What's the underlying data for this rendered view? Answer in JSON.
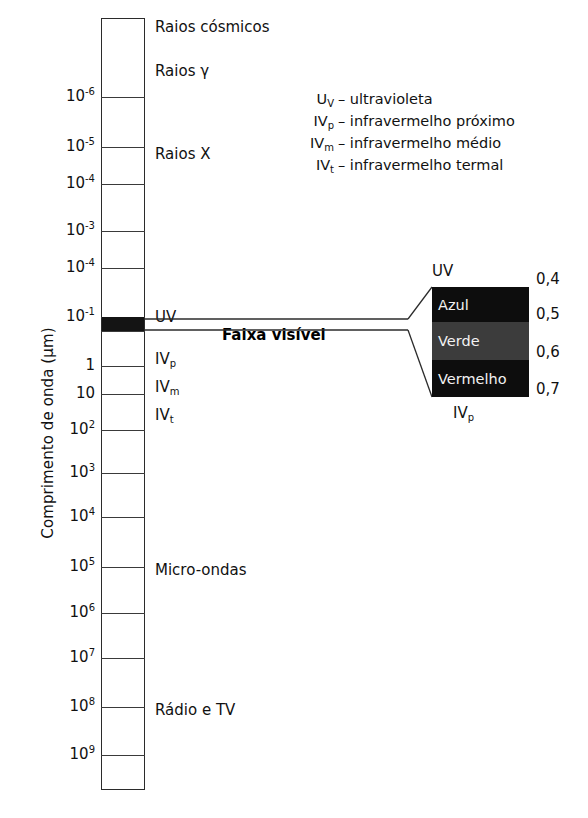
{
  "figure": {
    "axis_title": "Comprimento de onda (µm)"
  },
  "chart_data": {
    "type": "bar",
    "ylabel": "Comprimento de onda (µm)",
    "orientation": "vertical",
    "scale": "log",
    "tick_labels": [
      {
        "base": "10",
        "exp": "-6",
        "y": 97
      },
      {
        "base": "10",
        "exp": "-5",
        "y": 147
      },
      {
        "base": "10",
        "exp": "-4",
        "y": 184
      },
      {
        "base": "10",
        "exp": "-3",
        "y": 231
      },
      {
        "base": "10",
        "exp": "-4",
        "y": 268
      },
      {
        "base": "10",
        "exp": "-1",
        "y": 317
      },
      {
        "base": "1",
        "exp": "",
        "y": 366
      },
      {
        "base": "10",
        "exp": "",
        "y": 394
      },
      {
        "base": "10",
        "exp": "2",
        "y": 430
      },
      {
        "base": "10",
        "exp": "3",
        "y": 473
      },
      {
        "base": "10",
        "exp": "4",
        "y": 517
      },
      {
        "base": "10",
        "exp": "5",
        "y": 567
      },
      {
        "base": "10",
        "exp": "6",
        "y": 613
      },
      {
        "base": "10",
        "exp": "7",
        "y": 658
      },
      {
        "base": "10",
        "exp": "8",
        "y": 707
      },
      {
        "base": "10",
        "exp": "9",
        "y": 755
      }
    ],
    "tick_line_y": [
      97,
      147,
      184,
      231,
      268,
      317,
      331,
      366,
      394,
      430,
      473,
      517,
      567,
      613,
      658,
      707,
      755
    ],
    "visible_band": {
      "top": 317,
      "bottom": 331,
      "color": "#141414"
    },
    "bands": [
      {
        "name": "Raios cósmicos",
        "y": 28
      },
      {
        "name": "Raios γ",
        "y": 72
      },
      {
        "name": "Raios X",
        "y": 155
      },
      {
        "name": "UV",
        "y": 318
      },
      {
        "name": "IV",
        "sub": "p",
        "y": 360
      },
      {
        "name": "IV",
        "sub": "m",
        "y": 388
      },
      {
        "name": "IV",
        "sub": "t",
        "y": 416
      },
      {
        "name": "Micro-ondas",
        "y": 571
      },
      {
        "name": "Rádio e TV",
        "y": 711
      }
    ],
    "visible_range_label": "Faixa visível",
    "visible_range_label_y": 335
  },
  "legend": {
    "rows": [
      {
        "key": "U",
        "key_sub": "V",
        "text": "– ultravioleta"
      },
      {
        "key": "IV",
        "key_sub": "p",
        "text": "– infravermelho próximo"
      },
      {
        "key": "IV",
        "key_sub": "m",
        "text": "– infravermelho médio"
      },
      {
        "key": "IV",
        "key_sub": "t",
        "text": "– infravermelho termal"
      }
    ]
  },
  "inset": {
    "top_label": "UV",
    "bottom_label": "IV",
    "bottom_label_sub": "p",
    "bands": [
      {
        "name": "Azul",
        "top": 0,
        "height": 35,
        "color": "#0d0d0d"
      },
      {
        "name": "Verde",
        "top": 35,
        "height": 38,
        "color": "#3c3c3c"
      },
      {
        "name": "Vermelho",
        "top": 73,
        "height": 37,
        "color": "#0d0d0d"
      }
    ],
    "tick_labels": [
      {
        "value": "0,4",
        "y": 279
      },
      {
        "value": "0,5",
        "y": 314
      },
      {
        "value": "0,6",
        "y": 352
      },
      {
        "value": "0,7",
        "y": 389
      }
    ]
  }
}
